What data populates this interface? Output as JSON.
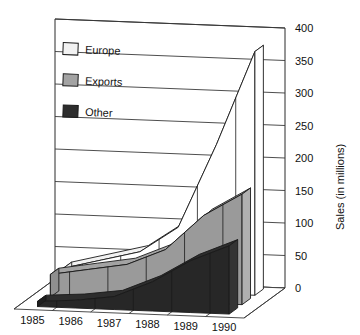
{
  "chart_data": {
    "type": "area",
    "title": "",
    "subtitle": "",
    "xlabel": "",
    "ylabel": "Sales (in millions)",
    "categories": [
      "1985",
      "1986",
      "1987",
      "1988",
      "1989",
      "1990"
    ],
    "x": [
      "1985",
      "1986",
      "1987",
      "1988",
      "1989",
      "1990"
    ],
    "series": [
      {
        "name": "Europe",
        "values": [
          30,
          45,
          60,
          100,
          230,
          375
        ],
        "color": "#f2f2f2"
      },
      {
        "name": "Exports",
        "values": [
          35,
          45,
          55,
          80,
          135,
          170
        ],
        "color": "#a3a3a3"
      },
      {
        "name": "Other",
        "values": [
          8,
          12,
          20,
          45,
          80,
          105
        ],
        "color": "#2d2d2d"
      }
    ],
    "ylim": [
      0,
      400
    ],
    "yticks": [
      0,
      50,
      100,
      150,
      200,
      250,
      300,
      350,
      400
    ],
    "ytick_labels": [
      "0",
      "50",
      "100",
      "150",
      "200",
      "250",
      "300",
      "350",
      "400"
    ],
    "grid": true,
    "legend_position": "top-left",
    "projection": "3d-ribbon"
  },
  "legend": {
    "items": [
      {
        "label": "Europe",
        "swatch": "#f2f2f2"
      },
      {
        "label": "Exports",
        "swatch": "#a3a3a3"
      },
      {
        "label": "Other",
        "swatch": "#2d2d2d"
      }
    ]
  },
  "axes": {
    "y_title": "Sales (in millions)",
    "y_ticks": [
      "400",
      "350",
      "300",
      "250",
      "200",
      "150",
      "100",
      "50",
      "0"
    ],
    "x_ticks": [
      "1985",
      "1986",
      "1987",
      "1988",
      "1989",
      "1990"
    ]
  },
  "colors": {
    "background": "#ffffff",
    "ink": "#111111",
    "grid": "#3a3a3a",
    "europe": "#f2f2f2",
    "exports": "#a3a3a3",
    "other": "#2d2d2d"
  }
}
